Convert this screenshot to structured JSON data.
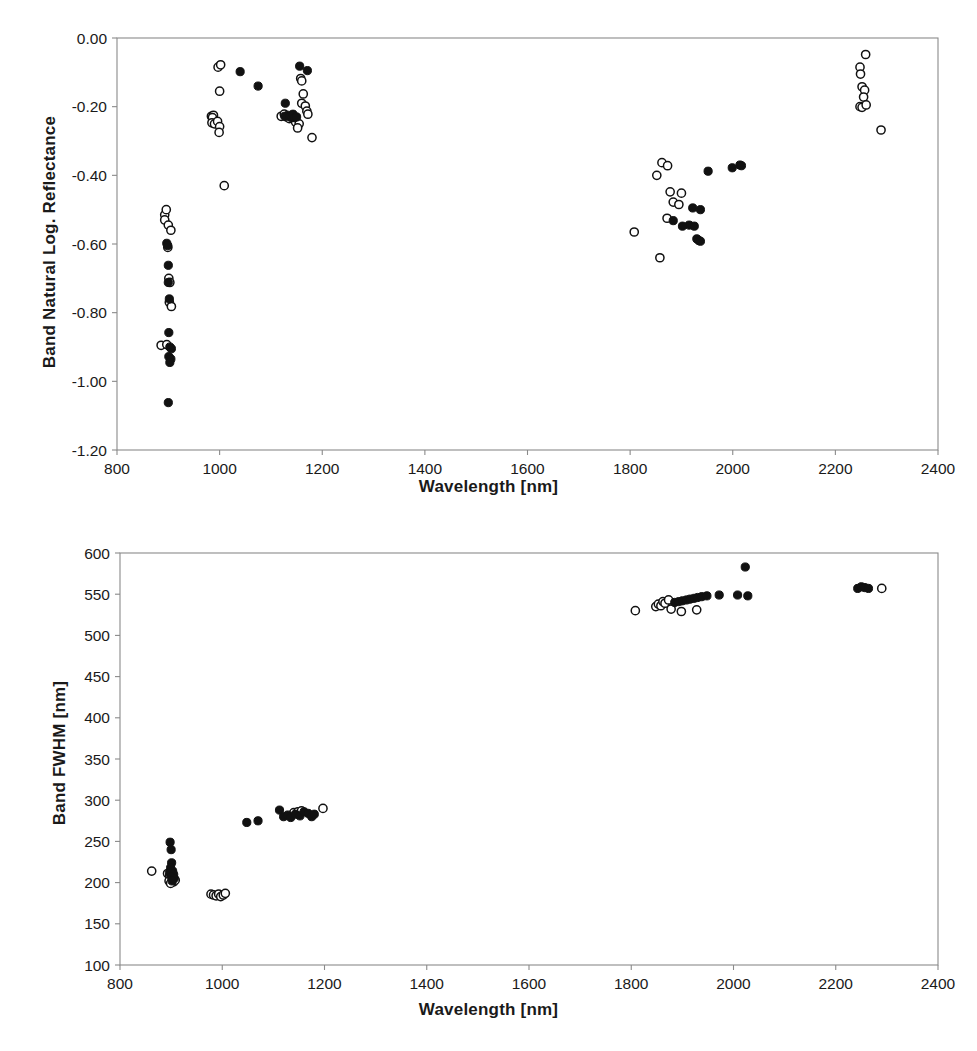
{
  "figure": {
    "background": "#ffffff",
    "marker_color": "#111111",
    "axis_color": "#8a8a8a"
  },
  "chart_data": [
    {
      "type": "scatter",
      "panel": "top",
      "title": "",
      "xlabel": "Wavelength [nm]",
      "ylabel": "Band Natural Log. Reflectance",
      "xlim": [
        800,
        2400
      ],
      "ylim": [
        -1.2,
        0.0
      ],
      "xticks": [
        800,
        1000,
        1200,
        1400,
        1600,
        1800,
        2000,
        2200,
        2400
      ],
      "yticks": [
        0.0,
        -0.2,
        -0.4,
        -0.6,
        -0.8,
        -1.0,
        -1.2
      ],
      "xtick_labels": [
        "800",
        "1000",
        "1200",
        "1400",
        "1600",
        "1800",
        "2000",
        "2200",
        "2400"
      ],
      "ytick_labels": [
        "0.00",
        "-0.20",
        "-0.40",
        "-0.60",
        "-0.80",
        "-1.00",
        "-1.20"
      ],
      "grid": false,
      "legend": "none",
      "series": [
        {
          "name": "open-markers",
          "marker": "open-circle",
          "points": [
            [
              893,
              -0.515
            ],
            [
              896,
              -0.5
            ],
            [
              893,
              -0.53
            ],
            [
              900,
              -0.545
            ],
            [
              905,
              -0.56
            ],
            [
              899,
              -0.61
            ],
            [
              901,
              -0.7
            ],
            [
              903,
              -0.712
            ],
            [
              902,
              -0.77
            ],
            [
              906,
              -0.782
            ],
            [
              886,
              -0.895
            ],
            [
              897,
              -0.893
            ],
            [
              997,
              -0.085
            ],
            [
              1002,
              -0.078
            ],
            [
              1000,
              -0.155
            ],
            [
              984,
              -0.228
            ],
            [
              988,
              -0.225
            ],
            [
              986,
              -0.232
            ],
            [
              985,
              -0.247
            ],
            [
              990,
              -0.25
            ],
            [
              996,
              -0.243
            ],
            [
              1000,
              -0.258
            ],
            [
              999,
              -0.275
            ],
            [
              1009,
              -0.43
            ],
            [
              1120,
              -0.228
            ],
            [
              1126,
              -0.222
            ],
            [
              1131,
              -0.23
            ],
            [
              1136,
              -0.235
            ],
            [
              1158,
              -0.118
            ],
            [
              1160,
              -0.125
            ],
            [
              1163,
              -0.163
            ],
            [
              1160,
              -0.19
            ],
            [
              1167,
              -0.198
            ],
            [
              1170,
              -0.213
            ],
            [
              1172,
              -0.222
            ],
            [
              1148,
              -0.245
            ],
            [
              1155,
              -0.25
            ],
            [
              1152,
              -0.262
            ],
            [
              1180,
              -0.29
            ],
            [
              1862,
              -0.363
            ],
            [
              1873,
              -0.372
            ],
            [
              1852,
              -0.4
            ],
            [
              1878,
              -0.448
            ],
            [
              1900,
              -0.452
            ],
            [
              1884,
              -0.478
            ],
            [
              1895,
              -0.485
            ],
            [
              1872,
              -0.525
            ],
            [
              1808,
              -0.565
            ],
            [
              1858,
              -0.64
            ],
            [
              2259,
              -0.048
            ],
            [
              2248,
              -0.085
            ],
            [
              2249,
              -0.105
            ],
            [
              2252,
              -0.142
            ],
            [
              2257,
              -0.152
            ],
            [
              2255,
              -0.172
            ],
            [
              2248,
              -0.2
            ],
            [
              2252,
              -0.202
            ],
            [
              2260,
              -0.195
            ],
            [
              2289,
              -0.268
            ]
          ]
        },
        {
          "name": "filled-markers",
          "marker": "filled-circle",
          "points": [
            [
              1040,
              -0.098
            ],
            [
              1075,
              -0.14
            ],
            [
              897,
              -0.598
            ],
            [
              899,
              -0.605
            ],
            [
              900,
              -0.662
            ],
            [
              900,
              -0.712
            ],
            [
              902,
              -0.76
            ],
            [
              901,
              -0.858
            ],
            [
              903,
              -0.9
            ],
            [
              906,
              -0.905
            ],
            [
              901,
              -0.928
            ],
            [
              905,
              -0.935
            ],
            [
              903,
              -0.945
            ],
            [
              900,
              -1.062
            ],
            [
              1133,
              -0.225
            ],
            [
              1127,
              -0.228
            ],
            [
              1136,
              -0.23
            ],
            [
              1141,
              -0.232
            ],
            [
              1143,
              -0.222
            ],
            [
              1146,
              -0.232
            ],
            [
              1150,
              -0.23
            ],
            [
              1128,
              -0.19
            ],
            [
              1156,
              -0.082
            ],
            [
              1171,
              -0.095
            ],
            [
              1952,
              -0.388
            ],
            [
              1999,
              -0.378
            ],
            [
              2014,
              -0.37
            ],
            [
              2017,
              -0.372
            ],
            [
              1922,
              -0.495
            ],
            [
              1937,
              -0.5
            ],
            [
              1884,
              -0.532
            ],
            [
              1915,
              -0.545
            ],
            [
              1925,
              -0.548
            ],
            [
              1930,
              -0.585
            ],
            [
              1934,
              -0.59
            ],
            [
              1937,
              -0.592
            ],
            [
              1902,
              -0.548
            ]
          ]
        }
      ]
    },
    {
      "type": "scatter",
      "panel": "bottom",
      "title": "",
      "xlabel": "Wavelength [nm]",
      "ylabel": "Band FWHM [nm]",
      "xlim": [
        800,
        2400
      ],
      "ylim": [
        100,
        600
      ],
      "xticks": [
        800,
        1000,
        1200,
        1400,
        1600,
        1800,
        2000,
        2200,
        2400
      ],
      "yticks": [
        100,
        150,
        200,
        250,
        300,
        350,
        400,
        450,
        500,
        550,
        600
      ],
      "xtick_labels": [
        "800",
        "1000",
        "1200",
        "1400",
        "1600",
        "1800",
        "2000",
        "2200",
        "2400"
      ],
      "ytick_labels": [
        "100",
        "150",
        "200",
        "250",
        "300",
        "350",
        "400",
        "450",
        "500",
        "550",
        "600"
      ],
      "grid": false,
      "legend": "none",
      "series": [
        {
          "name": "open-markers",
          "marker": "open-circle",
          "points": [
            [
              862,
              214
            ],
            [
              893,
              211
            ],
            [
              897,
              208
            ],
            [
              900,
              206
            ],
            [
              903,
              204
            ],
            [
              896,
              202
            ],
            [
              905,
              201
            ],
            [
              899,
              199
            ],
            [
              908,
              203
            ],
            [
              978,
              186
            ],
            [
              983,
              185
            ],
            [
              988,
              184
            ],
            [
              993,
              186
            ],
            [
              997,
              183
            ],
            [
              1002,
              185
            ],
            [
              1006,
              187
            ],
            [
              1140,
              285
            ],
            [
              1148,
              286
            ],
            [
              1155,
              287
            ],
            [
              1197,
              290
            ],
            [
              1808,
              530
            ],
            [
              1848,
              535
            ],
            [
              1853,
              538
            ],
            [
              1858,
              536
            ],
            [
              1862,
              541
            ],
            [
              1866,
              539
            ],
            [
              1873,
              543
            ],
            [
              1878,
              532
            ],
            [
              1898,
              529
            ],
            [
              1928,
              531
            ],
            [
              2290,
              557
            ]
          ]
        },
        {
          "name": "filled-markers",
          "marker": "filled-circle",
          "points": [
            [
              898,
              249
            ],
            [
              900,
              240
            ],
            [
              901,
              224
            ],
            [
              899,
              218
            ],
            [
              903,
              214
            ],
            [
              897,
              212
            ],
            [
              905,
              210
            ],
            [
              900,
              207
            ],
            [
              906,
              205
            ],
            [
              902,
              202
            ],
            [
              1048,
              273
            ],
            [
              1070,
              275
            ],
            [
              1112,
              288
            ],
            [
              1120,
              280
            ],
            [
              1128,
              282
            ],
            [
              1134,
              279
            ],
            [
              1143,
              283
            ],
            [
              1152,
              281
            ],
            [
              1160,
              286
            ],
            [
              1168,
              284
            ],
            [
              1175,
              280
            ],
            [
              1180,
              283
            ],
            [
              1885,
              540
            ],
            [
              1893,
              541
            ],
            [
              1900,
              542
            ],
            [
              1908,
              543
            ],
            [
              1915,
              544
            ],
            [
              1923,
              545
            ],
            [
              1930,
              546
            ],
            [
              1938,
              547
            ],
            [
              1948,
              548
            ],
            [
              1972,
              549
            ],
            [
              2008,
              549
            ],
            [
              2023,
              583
            ],
            [
              2028,
              548
            ],
            [
              2243,
              557
            ],
            [
              2250,
              559
            ],
            [
              2257,
              558
            ],
            [
              2264,
              557
            ]
          ]
        }
      ]
    }
  ]
}
